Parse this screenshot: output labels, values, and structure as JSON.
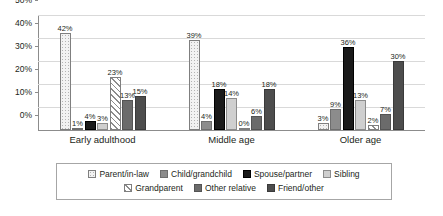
{
  "chart_data": {
    "type": "bar",
    "title": "",
    "subtitle": "",
    "xlabel": "",
    "ylabel": "",
    "ylim": [
      0,
      50
    ],
    "ytick_labels": [
      "0%",
      "10%",
      "20%",
      "30%",
      "40%",
      "50%"
    ],
    "ytick_values": [
      0,
      10,
      20,
      30,
      40,
      50
    ],
    "grid": true,
    "legend_position": "bottom",
    "categories": [
      "Early adulthood",
      "Middle age",
      "Older age"
    ],
    "series": [
      {
        "name": "Parent/in-law",
        "fill": "dotted",
        "color": "#f2f2f2",
        "values": [
          42,
          39,
          3
        ],
        "labels": [
          "42%",
          "39%",
          "3%"
        ]
      },
      {
        "name": "Child/grandchild",
        "fill": "mid-gray",
        "color": "#8c8c8c",
        "values": [
          1,
          4,
          9
        ],
        "labels": [
          "1%",
          "4%",
          "9%"
        ]
      },
      {
        "name": "Spouse/partner",
        "fill": "black",
        "color": "#1a1a1a",
        "values": [
          4,
          18,
          36
        ],
        "labels": [
          "4%",
          "18%",
          "36%"
        ]
      },
      {
        "name": "Sibling",
        "fill": "light-gray",
        "color": "#cfcfcf",
        "values": [
          3,
          14,
          13
        ],
        "labels": [
          "3%",
          "14%",
          "13%"
        ]
      },
      {
        "name": "Grandparent",
        "fill": "hatch",
        "color": "#ffffff",
        "values": [
          23,
          0,
          2
        ],
        "labels": [
          "23%",
          "0%",
          "2%"
        ]
      },
      {
        "name": "Other relative",
        "fill": "dark-gray",
        "color": "#6b6b6b",
        "values": [
          13,
          6,
          7
        ],
        "labels": [
          "13%",
          "6%",
          "7%"
        ]
      },
      {
        "name": "Friend/other",
        "fill": "darkest",
        "color": "#4d4d4d",
        "values": [
          15,
          18,
          30
        ],
        "labels": [
          "15%",
          "18%",
          "30%"
        ]
      }
    ]
  },
  "legend": {
    "row1": [
      "Parent/in-law",
      "Child/grandchild",
      "Spouse/partner",
      "Sibling"
    ],
    "row2": [
      "Grandparent",
      "Other relative",
      "Friend/other"
    ]
  },
  "axis": {
    "y_labels": [
      "50%",
      "40%",
      "30%",
      "20%",
      "10%",
      "0%"
    ]
  }
}
